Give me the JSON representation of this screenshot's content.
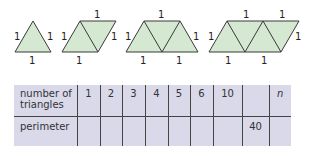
{
  "shapes": [
    {
      "triangles": 1,
      "edge_labels": [
        "1",
        "1",
        "1"
      ]
    },
    {
      "triangles": 2,
      "edge_labels": [
        "1",
        "1",
        "1",
        "1"
      ]
    },
    {
      "triangles": 3,
      "edge_labels": [
        "1",
        "1",
        "1",
        "1",
        "1"
      ]
    },
    {
      "triangles": 4,
      "edge_labels": [
        "1",
        "1",
        "1",
        "1",
        "1",
        "1"
      ]
    }
  ],
  "colors": {
    "fill": "#d5e8d2",
    "stroke": "#3a3a3a",
    "table_bg": "#d9d9ea"
  },
  "table": {
    "row1_label_line1": "number of",
    "row1_label_line2": "triangles",
    "row2_label": "perimeter",
    "row1": [
      "1",
      "2",
      "3",
      "4",
      "5",
      "6",
      "10",
      "",
      "n"
    ],
    "row2": [
      "",
      "",
      "",
      "",
      "",
      "",
      "",
      "40",
      ""
    ]
  }
}
